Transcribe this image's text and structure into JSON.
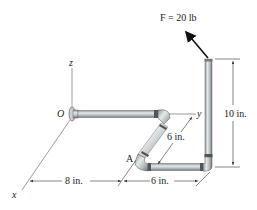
{
  "figure": {
    "force_label": "F = 20 lb",
    "axes": {
      "x": "x",
      "y": "y",
      "z": "z"
    },
    "points": {
      "origin": "O",
      "A": "A"
    },
    "dimensions": {
      "x_offset": "8 in.",
      "bottom_segment": "6 in.",
      "diagonal_segment": "6 in.",
      "vertical_height": "10 in."
    },
    "colors": {
      "pipe": "#b8bfc4",
      "pipe_dark": "#7e878c",
      "pipe_light": "#e3e7ea",
      "arrow": "#111111",
      "wall_glow": "#e8b9a6"
    }
  }
}
